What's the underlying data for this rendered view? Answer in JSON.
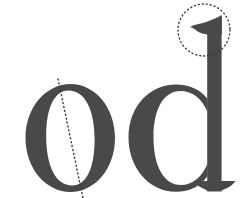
{
  "figure": {
    "kind": "letterform-annotation-diagram",
    "background_color": "#ffffff",
    "width": 249,
    "height": 198,
    "glyph_color": "#4a4948",
    "annotation_color": "#3a3a3a",
    "typeface_style": "serif / didone",
    "caption": "o d"
  },
  "glyphs": [
    {
      "id": "glyph-o",
      "character": "o",
      "label": "lowercase o",
      "fill": "#4a4948",
      "bounds": {
        "x": 25,
        "y": 84,
        "width": 90,
        "height": 108
      }
    },
    {
      "id": "glyph-d",
      "character": "d",
      "label": "lowercase d",
      "fill": "#4a4948",
      "bounds": {
        "x": 128,
        "y": 14,
        "width": 111,
        "height": 178
      }
    }
  ],
  "annotations": [
    {
      "id": "stress-axis",
      "type": "dotted-line",
      "target": "glyph-o",
      "label": "stress axis",
      "color": "#3a3a3a",
      "x1": 58,
      "y1": 79,
      "x2": 83,
      "y2": 198,
      "dash": "1 3",
      "stroke_width": 1.4
    },
    {
      "id": "ascender-flag-highlight",
      "type": "dotted-circle",
      "target": "glyph-d",
      "label": "ascender flag serif",
      "color": "#3a3a3a",
      "cx": 204,
      "cy": 30,
      "r": 26,
      "dash": "1 3",
      "stroke_width": 1.4
    }
  ],
  "accessibility": {
    "alt": "Serif lowercase o with a dotted diagonal stress axis line, beside a lowercase d whose ascender flag serif is circled with a dotted circle."
  }
}
